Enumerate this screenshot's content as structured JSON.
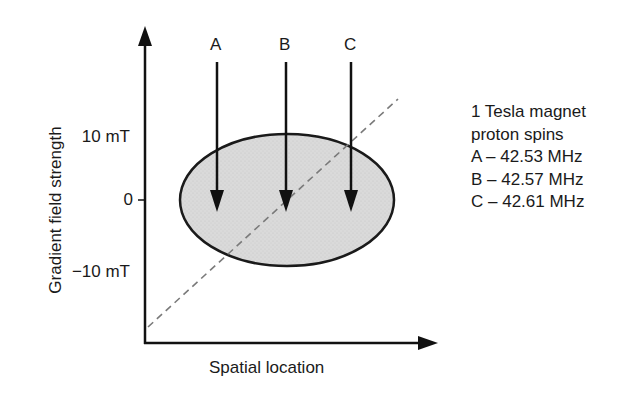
{
  "diagram": {
    "y_axis_label": "Gradient field strength",
    "x_axis_label": "Spatial location",
    "y_ticks": [
      {
        "label": "10 mT",
        "y": 137
      },
      {
        "label": "0",
        "y": 200
      },
      {
        "label": "−10 mT",
        "y": 272
      }
    ],
    "arrows": [
      {
        "label": "A",
        "x": 217
      },
      {
        "label": "B",
        "x": 286
      },
      {
        "label": "C",
        "x": 351
      }
    ],
    "legend": {
      "title_line1": "1 Tesla magnet",
      "title_line2": "proton spins",
      "entries": [
        "A – 42.53 MHz",
        "B – 42.57 MHz",
        "C – 42.61 MHz"
      ]
    },
    "colors": {
      "ellipse_fill": "#d9d9d9",
      "ellipse_stroke": "#1a1a1a",
      "gradient_line": "#808080",
      "axis": "#111111"
    }
  }
}
